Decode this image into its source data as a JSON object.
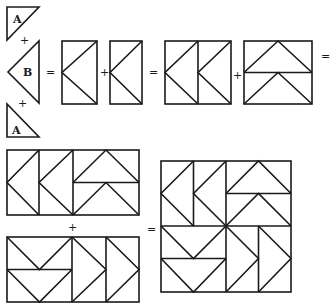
{
  "diagram": {
    "stroke_color": "#1a1a1a",
    "background": "#ffffff",
    "pieces": {
      "triangle_a_top": {
        "label": "A"
      },
      "triangle_b": {
        "label": "B"
      },
      "triangle_a_bottom": {
        "label": "A"
      }
    },
    "operators": {
      "plus_1": "+",
      "plus_2": "+",
      "equals_1": "=",
      "plus_3": "+",
      "equals_2": "=",
      "plus_4": "+",
      "equals_3": "=",
      "plus_5": "+",
      "equals_4": "="
    },
    "steps": [
      "A + B + A = flying-geese unit",
      "unit + unit = double unit",
      "double unit (left) + double unit (up) = half row",
      "half row + half row (rotated) = finished block"
    ]
  }
}
